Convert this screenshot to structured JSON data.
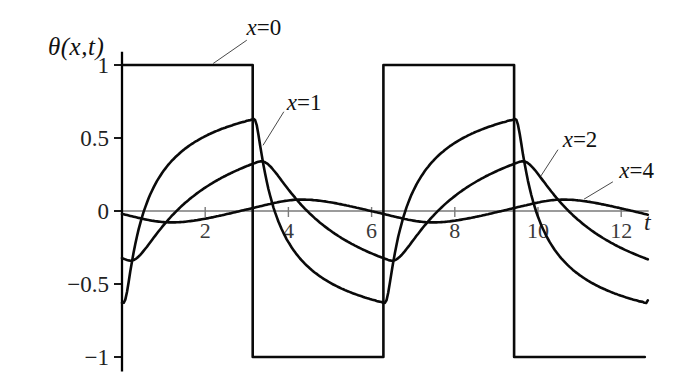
{
  "figure": {
    "ylabel": "θ(x,t)",
    "xlabel": "t"
  },
  "chart_data": {
    "type": "line",
    "title": "",
    "xlabel": "t",
    "ylabel": "θ(x,t)",
    "xlim": [
      0,
      12.66
    ],
    "ylim": [
      -1.1,
      1.09
    ],
    "grid": false,
    "legend_position": "inline-annotations-with-leader-lines",
    "xticks": [
      2,
      4,
      6,
      8,
      10,
      12
    ],
    "ytick_values": [
      1,
      0.5,
      0,
      -0.5,
      -1
    ],
    "ytick_labels": [
      "1",
      "0.5",
      "0",
      "−0.5",
      "−1"
    ],
    "model": "theta(x,t) = sum over odd n of (4/(n*pi))*exp(-x*sqrt(n/2))*sin(n*t - x*sqrt(n/2)); square-wave surface temperature of period 2*pi penetrating to depth x",
    "series": [
      {
        "label_prefix": "x",
        "label_suffix": "=0",
        "depth_x": 0,
        "kind": "square",
        "switch_times": [
          0,
          3.14159,
          6.28319,
          9.42478,
          12.56637
        ],
        "levels": [
          1,
          -1,
          1,
          -1
        ],
        "value_at_t0": 1,
        "peak_value": 1
      },
      {
        "label_prefix": "x",
        "label_suffix": "=1",
        "depth_x": 1,
        "kind": "fourier_response",
        "harmonic_count": 20,
        "value_at_t0": -0.63,
        "peak_value": 0.63,
        "peak_t": 3.14,
        "min_value": -0.63,
        "min_t": 6.28
      },
      {
        "label_prefix": "x",
        "label_suffix": "=2",
        "depth_x": 2,
        "kind": "fourier_response",
        "harmonic_count": 12,
        "value_at_t0": -0.33,
        "peak_value": 0.35,
        "peak_t": 3.25,
        "min_value": -0.35,
        "min_t": 6.5
      },
      {
        "label_prefix": "x",
        "label_suffix": "=4",
        "depth_x": 4,
        "kind": "fourier_response",
        "harmonic_count": 8,
        "value_at_t0": -0.02,
        "peak_value": 0.08,
        "peak_t": 4.4,
        "min_value": -0.08,
        "min_t": 1.3
      }
    ],
    "annotations": [
      {
        "prefix": "x",
        "suffix": "=0",
        "t": 3.41,
        "theta": 1.26,
        "leader": [
          [
            3.0,
            1.17
          ],
          [
            2.19,
            1.01
          ]
        ]
      },
      {
        "prefix": "x",
        "suffix": "=1",
        "t": 4.38,
        "theta": 0.75,
        "leader": [
          [
            3.89,
            0.68
          ],
          [
            3.39,
            0.45
          ]
        ]
      },
      {
        "prefix": "x",
        "suffix": "=2",
        "t": 11.01,
        "theta": 0.49,
        "leader": [
          [
            10.48,
            0.42
          ],
          [
            10.07,
            0.24
          ]
        ]
      },
      {
        "prefix": "x",
        "suffix": "=4",
        "t": 12.37,
        "theta": 0.28,
        "leader": [
          [
            11.8,
            0.2
          ],
          [
            11.1,
            0.08
          ]
        ]
      }
    ]
  }
}
